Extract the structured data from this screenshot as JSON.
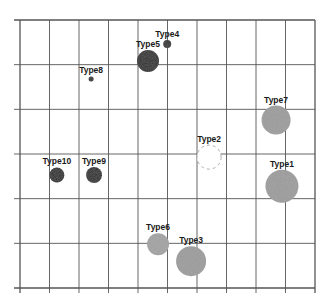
{
  "chart_data": {
    "type": "scatter",
    "subtype": "bubble",
    "title": "",
    "xlabel": "",
    "ylabel": "",
    "xlim": [
      0,
      10
    ],
    "ylim": [
      0,
      6
    ],
    "grid": true,
    "legend": "none",
    "x_ticks": [
      0,
      1,
      2,
      3,
      4,
      5,
      6,
      7,
      8,
      9,
      10
    ],
    "y_ticks": [
      0,
      1,
      2,
      3,
      4,
      5,
      6
    ],
    "tick_labels_visible": false,
    "points": [
      {
        "label": "Type4",
        "x": 4.99,
        "y": 5.46,
        "size": 4,
        "fill": "#2b2b2b",
        "style": "solid"
      },
      {
        "label": "Type5",
        "x": 4.34,
        "y": 5.08,
        "size": 11,
        "fill": "#2b2b2b",
        "style": "solid"
      },
      {
        "label": "Type8",
        "x": 2.41,
        "y": 4.68,
        "size": 2.5,
        "fill": "#2b2b2b",
        "style": "solid"
      },
      {
        "label": "Type7",
        "x": 8.68,
        "y": 3.76,
        "size": 14.5,
        "fill": "#9c9c9c",
        "style": "solid"
      },
      {
        "label": "Type2",
        "x": 6.41,
        "y": 2.93,
        "size": 12,
        "fill": "#ffffff",
        "style": "dashed"
      },
      {
        "label": "Type10",
        "x": 1.25,
        "y": 2.53,
        "size": 7.5,
        "fill": "#2b2b2b",
        "style": "solid"
      },
      {
        "label": "Type9",
        "x": 2.51,
        "y": 2.53,
        "size": 8,
        "fill": "#2b2b2b",
        "style": "solid"
      },
      {
        "label": "Type1",
        "x": 8.88,
        "y": 2.28,
        "size": 16.5,
        "fill": "#9c9c9c",
        "style": "solid"
      },
      {
        "label": "Type6",
        "x": 4.68,
        "y": 0.98,
        "size": 11,
        "fill": "#a3a3a3",
        "style": "solid"
      },
      {
        "label": "Type3",
        "x": 5.8,
        "y": 0.6,
        "size": 15,
        "fill": "#9c9c9c",
        "style": "solid"
      }
    ]
  }
}
